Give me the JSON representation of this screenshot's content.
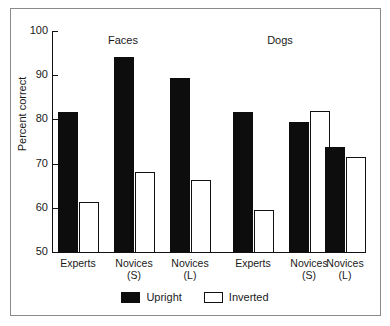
{
  "chart_data": {
    "type": "bar",
    "title": "",
    "xlabel": "",
    "ylabel": "Percent correct",
    "ylim": [
      50,
      100
    ],
    "yticks": [
      50,
      60,
      70,
      80,
      90,
      100
    ],
    "ytick_labels": [
      "50",
      "60",
      "70",
      "80",
      "90",
      "100"
    ],
    "grid": false,
    "legend_position": "bottom-center",
    "group_titles": [
      "Faces",
      "Dogs"
    ],
    "categories": [
      "Experts",
      "Novices (S)",
      "Novices (L)",
      "Experts",
      "Novices (S)",
      "Novices (L)"
    ],
    "category_lines": [
      {
        "line1": "Experts",
        "line2": ""
      },
      {
        "line1": "Novices",
        "line2": "(S)"
      },
      {
        "line1": "Novices",
        "line2": "(L)"
      },
      {
        "line1": "Experts",
        "line2": ""
      },
      {
        "line1": "Novices",
        "line2": "(S)"
      },
      {
        "line1": "Novices",
        "line2": "(L)"
      }
    ],
    "series": [
      {
        "name": "Upright",
        "color": "#0d0d0d",
        "values": [
          81.6,
          94.2,
          89.3,
          81.6,
          79.5,
          73.7
        ]
      },
      {
        "name": "Inverted",
        "color": "#ffffff",
        "values": [
          61.4,
          68.2,
          66.4,
          59.4,
          81.8,
          71.5
        ]
      }
    ],
    "groups": [
      {
        "name": "Faces",
        "bars": [
          {
            "category": "Experts",
            "upright": 81.6,
            "inverted": 61.4
          },
          {
            "category": "Novices (S)",
            "upright": 94.2,
            "inverted": 68.2
          },
          {
            "category": "Novices (L)",
            "upright": 89.3,
            "inverted": 66.4
          }
        ]
      },
      {
        "name": "Dogs",
        "bars": [
          {
            "category": "Experts",
            "upright": 81.6,
            "inverted": 59.4
          },
          {
            "category": "Novices (S)",
            "upright": 79.5,
            "inverted": 81.8
          },
          {
            "category": "Novices (L)",
            "upright": 73.7,
            "inverted": 71.5
          }
        ]
      }
    ]
  },
  "legend": {
    "items": [
      {
        "label": "Upright",
        "swatch": "filled-black-square"
      },
      {
        "label": "Inverted",
        "swatch": "open-white-square"
      }
    ]
  }
}
